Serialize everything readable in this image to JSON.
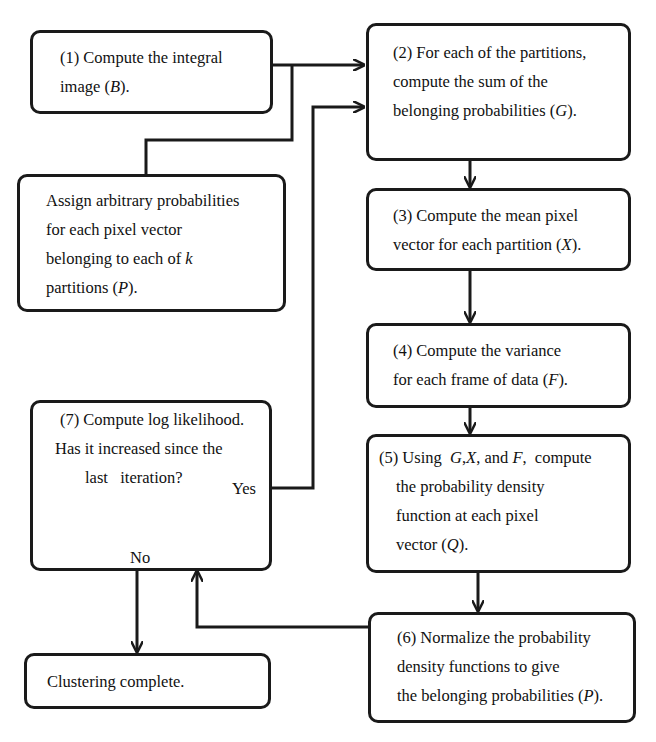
{
  "diagram": {
    "type": "flowchart",
    "colors": {
      "stroke": "#1a1a1a",
      "background": "#ffffff",
      "text": "#111111"
    },
    "nodes": {
      "step1": {
        "lines": [
          "(1) Compute the integral",
          "image (B)."
        ]
      },
      "step2": {
        "lines": [
          "(2) For each of the partitions,",
          "compute the sum of the",
          "belonging probabilities (G)."
        ]
      },
      "init": {
        "lines": [
          "Assign arbitrary probabilities",
          "for each pixel vector",
          "belonging to each of k",
          "partitions (P)."
        ]
      },
      "step3": {
        "lines": [
          "(3) Compute the mean pixel",
          "vector for each partition (X)."
        ]
      },
      "step4": {
        "lines": [
          "(4) Compute the variance",
          "for each frame of data (F)."
        ]
      },
      "step5": {
        "lines": [
          "(5) Using  G,X, and F,  compute",
          "the probability density",
          "function at each pixel",
          "vector (Q)."
        ]
      },
      "step6": {
        "lines": [
          "(6) Normalize the probability",
          "density functions to give",
          "the belonging probabilities (P)."
        ]
      },
      "step7": {
        "lines": [
          "(7) Compute log likelihood.",
          "Has it increased since the",
          "last   iteration?"
        ]
      },
      "done": {
        "lines": [
          "Clustering complete."
        ]
      }
    },
    "edge_labels": {
      "yes": "Yes",
      "no": "No"
    },
    "edges": [
      {
        "from": "step1",
        "to": "step2"
      },
      {
        "from": "init",
        "to": "step2"
      },
      {
        "from": "step2",
        "to": "step3"
      },
      {
        "from": "step3",
        "to": "step4"
      },
      {
        "from": "step4",
        "to": "step5"
      },
      {
        "from": "step5",
        "to": "step6"
      },
      {
        "from": "step6",
        "to": "step7"
      },
      {
        "from": "step7",
        "to": "step2",
        "label": "Yes"
      },
      {
        "from": "step7",
        "to": "done",
        "label": "No"
      }
    ]
  }
}
